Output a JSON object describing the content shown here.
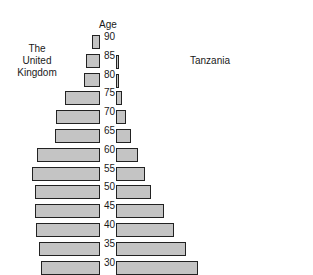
{
  "chart_data": {
    "type": "bar",
    "subtype": "population-pyramid",
    "title": "",
    "axis_title": "Age",
    "left_series_label": "The United Kingdom",
    "right_series_label": "Tanzania",
    "age_ticks": [
      "90",
      "85",
      "80",
      "75",
      "70",
      "65",
      "60",
      "55",
      "50",
      "45",
      "40",
      "35",
      "30"
    ],
    "categories": [
      "85-90",
      "80-85",
      "75-80",
      "70-75",
      "65-70",
      "60-65",
      "55-60",
      "50-55",
      "45-50",
      "40-45",
      "35-40",
      "30-35",
      "25-30"
    ],
    "series": [
      {
        "name": "The United Kingdom",
        "side": "left",
        "values": [
          8,
          14,
          16,
          35,
          44,
          45,
          63,
          68,
          65,
          65,
          64,
          61,
          59
        ]
      },
      {
        "name": "Tanzania",
        "side": "right",
        "values": [
          0,
          2,
          3,
          6,
          10,
          15,
          22,
          29,
          35,
          48,
          58,
          70,
          82
        ]
      }
    ],
    "units": "relative bar length (px, unlabeled scale)",
    "grid": false,
    "legend": "inline text labels"
  },
  "labels": {
    "uk_line1": "The",
    "uk_line2": "United",
    "uk_line3": "Kingdom",
    "tanzania": "Tanzania",
    "age": "Age"
  },
  "colors": {
    "bar_fill": "#c4c4c4",
    "bar_border": "#222222",
    "text": "#1a1a1a"
  }
}
